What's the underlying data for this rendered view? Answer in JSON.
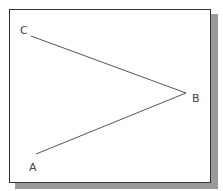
{
  "diagram": {
    "points": {
      "A": {
        "label": "A",
        "x": 36,
        "y": 154
      },
      "B": {
        "label": "B",
        "x": 186,
        "y": 93
      },
      "C": {
        "label": "C",
        "x": 31,
        "y": 36
      }
    },
    "segments": [
      [
        "C",
        "B"
      ],
      [
        "B",
        "A"
      ]
    ],
    "line_color": "#555555",
    "frame_color": "#333333",
    "shadow_color": "#9a9a9a"
  }
}
